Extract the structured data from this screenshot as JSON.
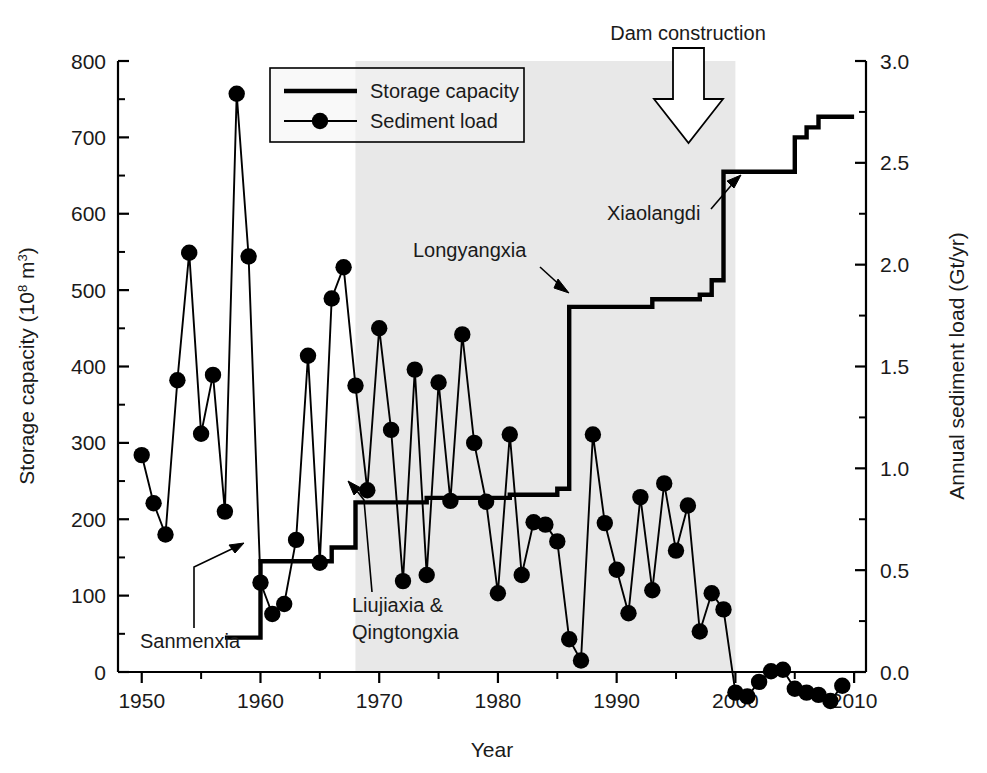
{
  "chart_data": {
    "type": "line",
    "title": "",
    "xlabel": "Year",
    "ylabel": "Storage capacity (10^8 m^3)",
    "y2label": "Annual sediment load (Gt/yr)",
    "xlim": [
      1948,
      2011
    ],
    "ylim": [
      0,
      800
    ],
    "y2lim": [
      0.0,
      3.0
    ],
    "grid": false,
    "legend_position": "top-center-left",
    "x_ticks": [
      1950,
      1960,
      1970,
      1980,
      1990,
      2000,
      2010
    ],
    "x_tick_labels": [
      "1950",
      "1960",
      "1970",
      "1980",
      "1990",
      "2000",
      "2010"
    ],
    "x_minor_ticks": [
      1955,
      1965,
      1975,
      1985,
      1995,
      2005
    ],
    "y_ticks": [
      0,
      100,
      200,
      300,
      400,
      500,
      600,
      700,
      800
    ],
    "y_tick_labels": [
      "0",
      "100",
      "200",
      "300",
      "400",
      "500",
      "600",
      "700",
      "800"
    ],
    "y2_ticks": [
      0.0,
      0.5,
      1.0,
      1.5,
      2.0,
      2.5,
      3.0
    ],
    "y2_tick_labels": [
      "0.0",
      "0.5",
      "1.0",
      "1.5",
      "2.0",
      "2.5",
      "3.0"
    ],
    "y2_minor_ticks": [
      0.25,
      0.75,
      1.25,
      1.75,
      2.25,
      2.75
    ],
    "series": [
      {
        "name": "Storage capacity",
        "style": "step",
        "axis": "left",
        "unit": "10^8 m^3",
        "points": [
          {
            "x": 1957,
            "y": 45
          },
          {
            "x": 1960,
            "y": 45
          },
          {
            "x": 1960,
            "y": 145
          },
          {
            "x": 1966,
            "y": 145
          },
          {
            "x": 1966,
            "y": 163
          },
          {
            "x": 1968,
            "y": 163
          },
          {
            "x": 1968,
            "y": 222
          },
          {
            "x": 1974,
            "y": 222
          },
          {
            "x": 1974,
            "y": 228
          },
          {
            "x": 1981,
            "y": 228
          },
          {
            "x": 1981,
            "y": 232
          },
          {
            "x": 1985,
            "y": 232
          },
          {
            "x": 1985,
            "y": 240
          },
          {
            "x": 1986,
            "y": 240
          },
          {
            "x": 1986,
            "y": 478
          },
          {
            "x": 1993,
            "y": 478
          },
          {
            "x": 1993,
            "y": 488
          },
          {
            "x": 1997,
            "y": 488
          },
          {
            "x": 1997,
            "y": 494
          },
          {
            "x": 1998,
            "y": 494
          },
          {
            "x": 1998,
            "y": 513
          },
          {
            "x": 1999,
            "y": 513
          },
          {
            "x": 1999,
            "y": 655
          },
          {
            "x": 2005,
            "y": 655
          },
          {
            "x": 2005,
            "y": 700
          },
          {
            "x": 2006,
            "y": 700
          },
          {
            "x": 2006,
            "y": 713
          },
          {
            "x": 2007,
            "y": 713
          },
          {
            "x": 2007,
            "y": 727
          },
          {
            "x": 2010,
            "y": 727
          }
        ]
      },
      {
        "name": "Sediment load",
        "style": "line-markers",
        "axis": "right",
        "unit": "Gt/yr",
        "points": [
          {
            "x": 1950,
            "y": 284
          },
          {
            "x": 1951,
            "y": 221
          },
          {
            "x": 1952,
            "y": 180
          },
          {
            "x": 1953,
            "y": 382
          },
          {
            "x": 1954,
            "y": 549
          },
          {
            "x": 1955,
            "y": 312
          },
          {
            "x": 1956,
            "y": 389
          },
          {
            "x": 1957,
            "y": 210
          },
          {
            "x": 1958,
            "y": 757
          },
          {
            "x": 1959,
            "y": 544
          },
          {
            "x": 1960,
            "y": 117
          },
          {
            "x": 1961,
            "y": 76
          },
          {
            "x": 1962,
            "y": 89
          },
          {
            "x": 1963,
            "y": 173
          },
          {
            "x": 1964,
            "y": 414
          },
          {
            "x": 1965,
            "y": 143
          },
          {
            "x": 1966,
            "y": 489
          },
          {
            "x": 1967,
            "y": 530
          },
          {
            "x": 1968,
            "y": 375
          },
          {
            "x": 1969,
            "y": 238
          },
          {
            "x": 1970,
            "y": 450
          },
          {
            "x": 1971,
            "y": 317
          },
          {
            "x": 1972,
            "y": 119
          },
          {
            "x": 1973,
            "y": 396
          },
          {
            "x": 1974,
            "y": 127
          },
          {
            "x": 1975,
            "y": 379
          },
          {
            "x": 1976,
            "y": 224
          },
          {
            "x": 1977,
            "y": 442
          },
          {
            "x": 1978,
            "y": 300
          },
          {
            "x": 1979,
            "y": 223
          },
          {
            "x": 1980,
            "y": 103
          },
          {
            "x": 1981,
            "y": 311
          },
          {
            "x": 1982,
            "y": 127
          },
          {
            "x": 1983,
            "y": 196
          },
          {
            "x": 1984,
            "y": 193
          },
          {
            "x": 1985,
            "y": 171
          },
          {
            "x": 1986,
            "y": 43
          },
          {
            "x": 1987,
            "y": 15
          },
          {
            "x": 1988,
            "y": 311
          },
          {
            "x": 1989,
            "y": 195
          },
          {
            "x": 1990,
            "y": 134
          },
          {
            "x": 1991,
            "y": 77
          },
          {
            "x": 1992,
            "y": 229
          },
          {
            "x": 1993,
            "y": 107
          },
          {
            "x": 1994,
            "y": 247
          },
          {
            "x": 1995,
            "y": 159
          },
          {
            "x": 1996,
            "y": 218
          },
          {
            "x": 1997,
            "y": 53
          },
          {
            "x": 1998,
            "y": 103
          },
          {
            "x": 1999,
            "y": 82
          },
          {
            "x": 2000,
            "y": -27
          },
          {
            "x": 2001,
            "y": -32
          },
          {
            "x": 2002,
            "y": -13
          },
          {
            "x": 2003,
            "y": 1
          },
          {
            "x": 2004,
            "y": 3
          },
          {
            "x": 2005,
            "y": -22
          },
          {
            "x": 2006,
            "y": -27
          },
          {
            "x": 2007,
            "y": -30
          },
          {
            "x": 2008,
            "y": -38
          },
          {
            "x": 2009,
            "y": -18
          }
        ]
      }
    ],
    "shaded_region": {
      "x_start": 1968,
      "x_end": 2000,
      "color": "#e8e8e8"
    },
    "annotations": [
      {
        "label": "Dam construction",
        "kind": "arrow-down-outline"
      },
      {
        "label": "Sanmenxia",
        "kind": "elbow-arrow"
      },
      {
        "label": "Liujiaxia &",
        "kind": "elbow-arrow"
      },
      {
        "label": "Qingtongxia",
        "kind": "text-continuation"
      },
      {
        "label": "Longyangxia",
        "kind": "arrow"
      },
      {
        "label": "Xiaolangdi",
        "kind": "arrow"
      }
    ]
  },
  "axes": {
    "left_title_main": "Storage capacity (10",
    "left_title_sup": "8",
    "left_title_mid": " m",
    "left_title_sup2": "3",
    "left_title_end": ")",
    "right_title": "Annual sediment load (Gt/yr)",
    "x_title": "Year"
  },
  "legend": {
    "items": [
      {
        "label": "Storage capacity",
        "marker": "line"
      },
      {
        "label": "Sediment load",
        "marker": "line-dot"
      }
    ]
  },
  "annotations": {
    "dam_construction": "Dam construction",
    "sanmenxia": "Sanmenxia",
    "liujiaxia": "Liujiaxia &",
    "qingtongxia": "Qingtongxia",
    "longyangxia": "Longyangxia",
    "xiaolangdi": "Xiaolangdi"
  },
  "ticks": {
    "x": [
      "1950",
      "1960",
      "1970",
      "1980",
      "1990",
      "2000",
      "2010"
    ],
    "y_left": [
      "800",
      "700",
      "600",
      "500",
      "400",
      "300",
      "200",
      "100",
      "0"
    ],
    "y_right": [
      "3.0",
      "2.5",
      "2.0",
      "1.5",
      "1.0",
      "0.5",
      "0.0"
    ]
  },
  "colors": {
    "line": "#000000",
    "shade": "#e8e8e8",
    "text": "#1a1a1a"
  }
}
